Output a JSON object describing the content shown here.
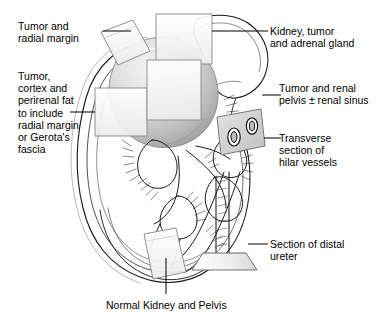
{
  "figure": {
    "width": 391,
    "height": 323,
    "background_color": "#ffffff",
    "ink_color": "#1a1a1a"
  },
  "labels": {
    "tumor_radial_margin": "Tumor and\nradial margin",
    "tumor_cortex_perirenal": "Tumor,\ncortex and\nperirenal fat\nto include\nradial margin\nor Gerota's\nfascia",
    "kidney_tumor_adrenal": "Kidney, tumor\nand adrenal gland",
    "tumor_renal_pelvis": "Tumor and renal\npelvis ± renal sinus",
    "transverse_hilar_vessels": "Transverse\nsection of\nhilar vessels",
    "section_distal_ureter": "Section of distal\nureter",
    "normal_kidney_pelvis": "Normal Kidney and Pelvis"
  },
  "anatomy": {
    "tumor": {
      "name": "tumor-mass",
      "fill_light": "#f2f2f2",
      "fill_mid": "#cfcfcf",
      "fill_dark": "#9e9e9e",
      "outline": "#6e6e6e"
    },
    "kidney": {
      "name": "kidney-body",
      "outline": "#1a1a1a",
      "fill": "#ffffff"
    },
    "adrenal_gland": {
      "name": "adrenal-gland",
      "outline": "#1a1a1a",
      "fill": "#ffffff"
    },
    "hilar_vessels": {
      "name": "hilar-vessel-cross-sections",
      "count": 2,
      "plane_fill": "#d9d9d9",
      "vessel_outline": "#1a1a1a"
    },
    "ureter": {
      "name": "distal-ureter",
      "base_plate_fill": "#d4d4d4",
      "outline": "#1a1a1a"
    },
    "renal_pelvis": {
      "name": "renal-pelvis-calyces",
      "outline": "#1a1a1a"
    }
  },
  "section_planes": [
    {
      "name": "plane-tumor-radial-margin",
      "fill": "#fbfbfb",
      "stroke": "#8c8c8c"
    },
    {
      "name": "plane-kidney-tumor-adrenal",
      "fill": "#fbfbfb",
      "stroke": "#8c8c8c"
    },
    {
      "name": "plane-tumor-cortex-perirenal",
      "fill": "#fbfbfb",
      "stroke": "#8c8c8c"
    },
    {
      "name": "plane-tumor-renal-pelvis",
      "fill": "#fbfbfb",
      "stroke": "#8c8c8c"
    },
    {
      "name": "plane-hilar-vessels",
      "fill": "#d9d9d9",
      "stroke": "#6e6e6e"
    },
    {
      "name": "plane-distal-ureter",
      "fill": "#d4d4d4",
      "stroke": "#6e6e6e"
    },
    {
      "name": "plane-normal-kidney-pelvis",
      "fill": "#fbfbfb",
      "stroke": "#8c8c8c"
    }
  ],
  "leader_lines": {
    "stroke": "#000000",
    "width": 1
  }
}
